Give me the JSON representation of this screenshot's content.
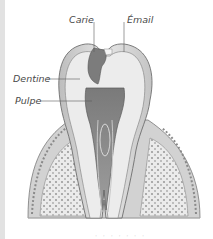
{
  "diagram": {
    "labels": {
      "carie": "Carie",
      "email": "Émail",
      "dentine": "Dentine",
      "pulpe": "Pulpe"
    },
    "caption": "· · ·  ·  · ·  ·"
  },
  "colors": {
    "background": "#ffffff",
    "left_strip": "#e2e2e2",
    "enamel": "#d9d9d9",
    "dentine": "#ececec",
    "pulp": "#8a8a8a",
    "caries": "#7c7c7c",
    "bone": "#e8e8e8",
    "bone_dots": "#9c9c9c",
    "gum": "#cfcfcf",
    "outline": "#6e6e6e",
    "label_text": "#4a4a4a"
  }
}
